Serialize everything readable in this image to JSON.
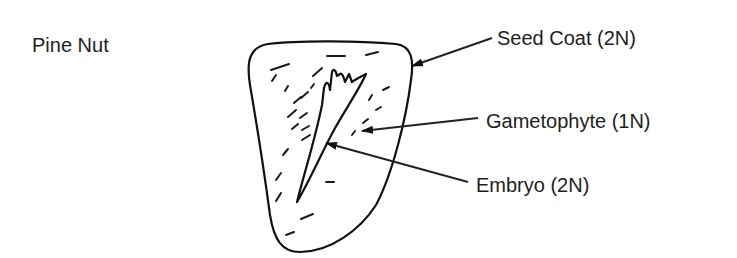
{
  "diagram": {
    "title": "Pine Nut",
    "labels": [
      {
        "id": "seed-coat",
        "text": "Seed Coat (2N)"
      },
      {
        "id": "gametophyte",
        "text": "Gametophyte (1N)"
      },
      {
        "id": "embryo",
        "text": "Embryo (2N)"
      }
    ]
  },
  "colors": {
    "ink": "#1e1e1e",
    "background": "#ffffff"
  }
}
